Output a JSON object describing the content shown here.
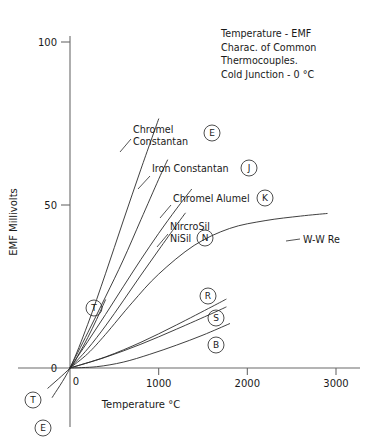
{
  "chart_data": {
    "type": "line",
    "title_lines": [
      "Temperature - EMF",
      "Charac. of Common",
      "Thermocouples.",
      "Cold Junction - 0 °C"
    ],
    "xlabel": "Temperature °C",
    "ylabel": "EMF Millivolts",
    "xlim": [
      -300,
      3200
    ],
    "ylim": [
      -12,
      108
    ],
    "xticks": [
      0,
      1000,
      2000,
      3000
    ],
    "xtick_labels": [
      "0",
      "1000",
      "2000",
      "3000"
    ],
    "yticks": [
      0,
      50,
      100
    ],
    "ytick_labels": [
      "0",
      "50",
      "100"
    ],
    "grid": false,
    "legend_position": "inline-annotations",
    "series": [
      {
        "name": "Chromel Constantan",
        "letter": "E",
        "label_lines": [
          "Chromel",
          "Constantan"
        ],
        "points": [
          [
            -200,
            -9.0
          ],
          [
            0,
            0
          ],
          [
            200,
            13.4
          ],
          [
            400,
            28.9
          ],
          [
            600,
            45.1
          ],
          [
            800,
            61.0
          ],
          [
            1000,
            76.4
          ]
        ]
      },
      {
        "name": "Iron Constantan",
        "letter": "J",
        "label_lines": [
          "Iron Constantan"
        ],
        "points": [
          [
            0,
            0
          ],
          [
            200,
            10.8
          ],
          [
            400,
            21.8
          ],
          [
            600,
            33.1
          ],
          [
            800,
            45.5
          ],
          [
            1000,
            57.9
          ],
          [
            1100,
            63.8
          ]
        ]
      },
      {
        "name": "Chromel Alumel",
        "letter": "K",
        "label_lines": [
          "Chromel Alumel"
        ],
        "points": [
          [
            0,
            0
          ],
          [
            200,
            8.1
          ],
          [
            400,
            16.4
          ],
          [
            600,
            24.9
          ],
          [
            800,
            33.3
          ],
          [
            1000,
            41.3
          ],
          [
            1200,
            48.8
          ],
          [
            1370,
            54.8
          ]
        ]
      },
      {
        "name": "NircroSil NiSil",
        "letter": "N",
        "label_lines": [
          "NircroSil",
          "NiSil"
        ],
        "points": [
          [
            0,
            0
          ],
          [
            200,
            5.9
          ],
          [
            400,
            12.9
          ],
          [
            600,
            20.6
          ],
          [
            800,
            28.5
          ],
          [
            1000,
            36.2
          ],
          [
            1200,
            43.8
          ],
          [
            1300,
            47.5
          ]
        ]
      },
      {
        "name": "Copper Constantan",
        "letter": "T",
        "label_lines": [],
        "points": [
          [
            -250,
            -6.2
          ],
          [
            0,
            0
          ],
          [
            100,
            4.3
          ],
          [
            200,
            9.3
          ],
          [
            300,
            14.9
          ],
          [
            400,
            20.9
          ]
        ]
      },
      {
        "name": "Platinum Rhodium 13%",
        "letter": "R",
        "label_lines": [],
        "points": [
          [
            0,
            0
          ],
          [
            400,
            3.4
          ],
          [
            800,
            7.9
          ],
          [
            1200,
            13.2
          ],
          [
            1600,
            18.8
          ],
          [
            1760,
            21.1
          ]
        ]
      },
      {
        "name": "Platinum Rhodium 10%",
        "letter": "S",
        "label_lines": [],
        "points": [
          [
            0,
            0
          ],
          [
            400,
            3.3
          ],
          [
            800,
            7.3
          ],
          [
            1200,
            11.9
          ],
          [
            1600,
            16.7
          ],
          [
            1760,
            18.7
          ]
        ]
      },
      {
        "name": "Platinum Rhodium 30/6",
        "letter": "B",
        "label_lines": [],
        "points": [
          [
            0,
            0
          ],
          [
            300,
            0.4
          ],
          [
            600,
            1.8
          ],
          [
            900,
            4.2
          ],
          [
            1200,
            7.0
          ],
          [
            1500,
            10.1
          ],
          [
            1800,
            13.6
          ]
        ]
      },
      {
        "name": "W-W Re",
        "letter": "",
        "label_lines": [
          "W-W Re"
        ],
        "points": [
          [
            0,
            0
          ],
          [
            200,
            4.4
          ],
          [
            400,
            10.3
          ],
          [
            700,
            20.0
          ],
          [
            1000,
            28.8
          ],
          [
            1400,
            37.6
          ],
          [
            1800,
            42.8
          ],
          [
            2200,
            45.2
          ],
          [
            2600,
            46.6
          ],
          [
            2900,
            47.4
          ]
        ]
      }
    ],
    "annotations": [
      {
        "letter": "E",
        "role": "below-origin-marker"
      },
      {
        "letter": "T",
        "role": "below-origin-marker"
      },
      {
        "letter": "T",
        "role": "on-curve-marker"
      }
    ]
  }
}
